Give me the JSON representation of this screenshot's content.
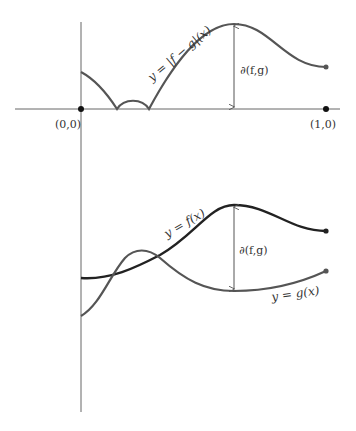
{
  "figure": {
    "top_panel": {
      "curve_label": "y = |f − g|(x)",
      "distance_label": "∂(f,g)",
      "origin_label": "(0,0)",
      "end_label": "(1,0)"
    },
    "bottom_panel": {
      "f_label": "y = f(x)",
      "g_label": "y = g(x)",
      "distance_label": "∂(f,g)"
    },
    "colors": {
      "axis": "#666666",
      "abs_curve": "#555555",
      "f_curve": "#222222",
      "g_curve": "#555555",
      "dot": "#111111",
      "text": "#333333"
    }
  }
}
